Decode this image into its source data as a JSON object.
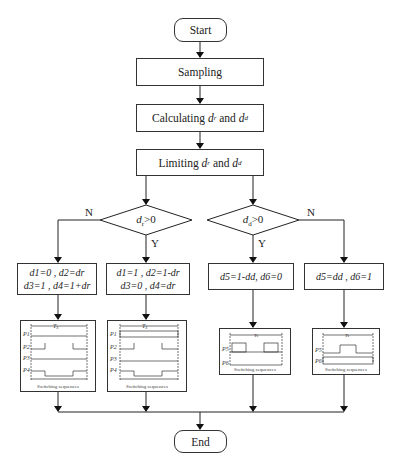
{
  "flowchart": {
    "start": "Start",
    "sampling": "Sampling",
    "calculating": {
      "prefix": "Calculating ",
      "v1": "d",
      "s1": "r",
      "mid": " and ",
      "v2": "d",
      "s2": "d"
    },
    "limiting": {
      "prefix": "Limiting ",
      "v1": "d",
      "s1": "r",
      "mid": " and ",
      "v2": "d",
      "s2": "d"
    },
    "decision_left": {
      "text": "dr>0",
      "yes": "Y",
      "no": "N"
    },
    "decision_right": {
      "text": "dd>0",
      "yes": "Y",
      "no": "N"
    },
    "box_a": {
      "line1": "d1=0 , d2=dr",
      "line2": "d3=1 , d4=1+dr"
    },
    "box_b": {
      "line1": "d1=1 , d2=1-dr",
      "line2": "d3=0 , d4=dr"
    },
    "box_c": {
      "line1": "d5=1-dd, d6=0"
    },
    "box_d": {
      "line1": "d5=dd , d6=1"
    },
    "switching_caption": "Switching sequences",
    "period_label": "Ts",
    "end": "End"
  }
}
